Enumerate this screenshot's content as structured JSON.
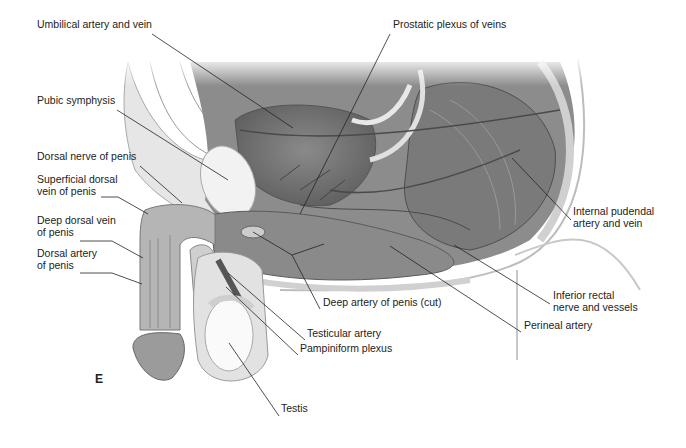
{
  "figure": {
    "panel_letter": "E",
    "style": "grayscale anatomical illustration, sagittal section of male pelvis",
    "colors": {
      "ink": "#222222",
      "tissue_dark": "#6e6e6e",
      "tissue_mid": "#9a9a9a",
      "tissue_light": "#d4d4d4",
      "bone": "#e8e8e8",
      "background": "#ffffff"
    }
  },
  "labels": [
    {
      "id": "umbilical",
      "text": "Umbilical artery and vein",
      "x": 37,
      "y": 28
    },
    {
      "id": "prostatic",
      "text": "Prostatic plexus of veins",
      "x": 393,
      "y": 28
    },
    {
      "id": "pubic",
      "text": "Pubic symphysis",
      "x": 37,
      "y": 104
    },
    {
      "id": "dorsal-nerve",
      "text": "Dorsal nerve of penis",
      "x": 37,
      "y": 160
    },
    {
      "id": "superficial-dorsal-vein",
      "text": "Superficial dorsal\nvein of penis",
      "x": 37,
      "y": 183
    },
    {
      "id": "deep-dorsal-vein",
      "text": "Deep dorsal vein\nof penis",
      "x": 37,
      "y": 224
    },
    {
      "id": "dorsal-artery",
      "text": "Dorsal artery\nof penis",
      "x": 37,
      "y": 257
    },
    {
      "id": "internal-pudendal",
      "text": "Internal pudendal\nartery and vein",
      "x": 573,
      "y": 215
    },
    {
      "id": "deep-artery",
      "text": "Deep artery of penis (cut)",
      "x": 323,
      "y": 306
    },
    {
      "id": "inferior-rectal",
      "text": "Inferior rectal\nnerve and vessels",
      "x": 553,
      "y": 299
    },
    {
      "id": "perineal",
      "text": "Perineal artery",
      "x": 524,
      "y": 329
    },
    {
      "id": "testicular",
      "text": "Testicular artery",
      "x": 307,
      "y": 337
    },
    {
      "id": "pampiniform",
      "text": "Pampiniform plexus",
      "x": 300,
      "y": 352
    },
    {
      "id": "testis",
      "text": "Testis",
      "x": 281,
      "y": 412
    }
  ],
  "leaders": [
    {
      "id": "umbilical",
      "points": "152,34 293,128"
    },
    {
      "id": "prostatic",
      "points": "390,34 300,214"
    },
    {
      "id": "pubic",
      "points": "117,110 228,180"
    },
    {
      "id": "dorsal-nerve",
      "points": "140,166 182,203"
    },
    {
      "id": "superficial-dorsal-vein",
      "points": "101,197 118,197 148,214"
    },
    {
      "id": "deep-dorsal-vein",
      "points": "80,241 112,241 143,258"
    },
    {
      "id": "dorsal-artery",
      "points": "80,273 112,273 142,284"
    },
    {
      "id": "internal-pudendal",
      "points": "571,220 512,158"
    },
    {
      "id": "deep-artery",
      "points": "320,309 292,255 253,232"
    },
    {
      "id": "deep-artery-branch",
      "points": "292,255 324,244"
    },
    {
      "id": "inferior-rectal",
      "points": "550,304 454,245"
    },
    {
      "id": "perineal",
      "points": "521,332 390,246"
    },
    {
      "id": "testicular",
      "points": "305,340 228,273"
    },
    {
      "id": "pampiniform",
      "points": "298,355 226,287"
    },
    {
      "id": "testis",
      "points": "279,416 229,343"
    }
  ]
}
